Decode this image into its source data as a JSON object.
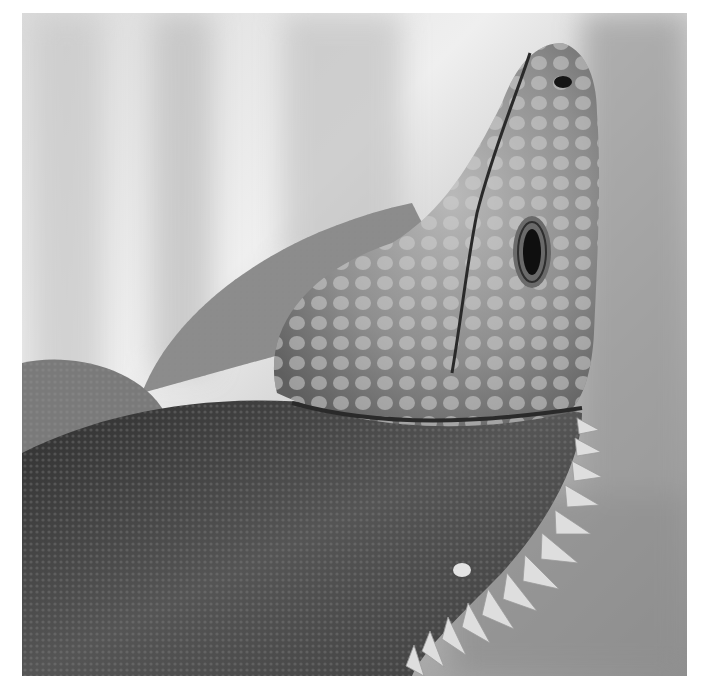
{
  "image": {
    "subject": "Close-up black-and-white photograph of an iguana looking upward",
    "alt": "Grayscale close-up of an iguana's head tilted upward, showing a large scaled head, an eye, a textured dewlap edged with pale spines, against a blurred background",
    "style": "monochrome",
    "colors": {
      "background_light": "#e6e6e6",
      "background_mid": "#a8a8a8",
      "skin_mid": "#8a8a8a",
      "skin_dark": "#3a3a3a",
      "spine": "#dcdcdc",
      "eye": "#111111"
    },
    "regions": [
      {
        "name": "head",
        "description": "Upward-pointing head with large rounded scales and a nostril near the tip"
      },
      {
        "name": "eye",
        "description": "Vertical elliptical eye with concentric eyelid folds"
      },
      {
        "name": "dewlap",
        "description": "Dark mottled throat fan with fine scale grid"
      },
      {
        "name": "spines",
        "description": "Row of pale conical spines along the dewlap edge"
      },
      {
        "name": "body",
        "description": "Coarse textured body and limb at the left"
      },
      {
        "name": "background",
        "description": "Soft blurred light-gray background with tree-trunk shapes"
      }
    ]
  }
}
